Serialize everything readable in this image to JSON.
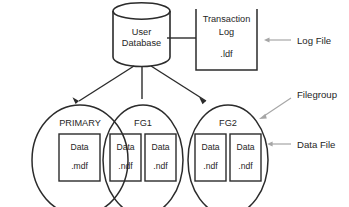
{
  "diagram": {
    "title_present": false,
    "background_color": "#ffffff",
    "line_color": "#2b2b2b",
    "annotation_color": "#a6a6a6",
    "text_color": "#262626",
    "database": {
      "shape": "cylinder",
      "line1": "User",
      "line2": "Database"
    },
    "transaction_log": {
      "shape": "open-top-rectangle",
      "line1": "Transaction",
      "line2": "Log",
      "line3": ".ldf"
    },
    "filegroups": [
      {
        "name": "PRIMARY",
        "files": [
          {
            "line1": "Data",
            "line2": ".mdf"
          }
        ]
      },
      {
        "name": "FG1",
        "files": [
          {
            "line1": "Data",
            "line2": ".ndf"
          },
          {
            "line1": "Data",
            "line2": ".ndf"
          }
        ]
      },
      {
        "name": "FG2",
        "files": [
          {
            "line1": "Data",
            "line2": ".ndf"
          },
          {
            "line1": "Data",
            "line2": ".ndf"
          }
        ]
      }
    ],
    "annotations": [
      {
        "label": "Log File",
        "target": "transaction-log",
        "arrow": "horizontal-left"
      },
      {
        "label": "Filegroup",
        "target": "filegroup-fg2-ellipse",
        "arrow": "diagonal-down-left"
      },
      {
        "label": "Data File",
        "target": "fg2-second-data-file",
        "arrow": "horizontal-left"
      }
    ]
  }
}
